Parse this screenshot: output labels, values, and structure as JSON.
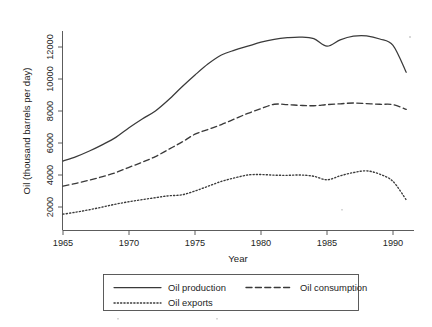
{
  "chart_data": {
    "type": "line",
    "title": "",
    "xlabel": "Year",
    "ylabel": "Oil (thousand barrels per day)",
    "xlim": [
      1965,
      1991
    ],
    "ylim": [
      1300,
      13200
    ],
    "xticks": [
      1965,
      1970,
      1975,
      1980,
      1985,
      1990
    ],
    "yticks": [
      2000,
      4000,
      6000,
      8000,
      10000,
      12000
    ],
    "xtick_labels": [
      "1965",
      "1970",
      "1975",
      "1980",
      "1985",
      "1990"
    ],
    "ytick_labels": [
      "2000",
      "4000",
      "6000",
      "8000",
      "10000",
      "12000"
    ],
    "grid": false,
    "legend_position": "below-center",
    "x": [
      1965,
      1966,
      1967,
      1968,
      1969,
      1970,
      1971,
      1972,
      1973,
      1974,
      1975,
      1976,
      1977,
      1978,
      1979,
      1980,
      1981,
      1982,
      1983,
      1984,
      1985,
      1986,
      1987,
      1988,
      1989,
      1990,
      1991
    ],
    "series": [
      {
        "name": "Oil production",
        "style": "solid",
        "values": [
          4870,
          5150,
          5500,
          5900,
          6350,
          6950,
          7500,
          8000,
          8700,
          9500,
          10250,
          10950,
          11500,
          11800,
          12050,
          12300,
          12480,
          12580,
          12620,
          12520,
          12050,
          12450,
          12680,
          12700,
          12500,
          12100,
          10420
        ]
      },
      {
        "name": "Oil consumption",
        "style": "dashed",
        "values": [
          3300,
          3480,
          3680,
          3900,
          4150,
          4480,
          4800,
          5150,
          5600,
          6050,
          6550,
          6850,
          7150,
          7500,
          7850,
          8150,
          8420,
          8400,
          8350,
          8330,
          8400,
          8450,
          8500,
          8460,
          8420,
          8400,
          8100
        ]
      },
      {
        "name": "Oil exports",
        "style": "dotted",
        "values": [
          1550,
          1680,
          1830,
          2000,
          2180,
          2330,
          2460,
          2580,
          2700,
          2760,
          3000,
          3300,
          3600,
          3820,
          4000,
          4030,
          3990,
          3980,
          4000,
          3920,
          3700,
          3950,
          4150,
          4260,
          4050,
          3600,
          2450
        ]
      }
    ]
  },
  "legend": {
    "entries": [
      {
        "label": "Oil production",
        "style": "solid"
      },
      {
        "label": "Oil consumption",
        "style": "dashed"
      },
      {
        "label": "Oil exports",
        "style": "dotted"
      }
    ]
  }
}
